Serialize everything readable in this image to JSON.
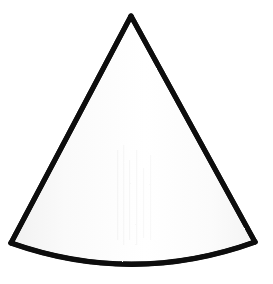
{
  "canvas": {
    "width": 273,
    "height": 284,
    "background_color": "#ffffff",
    "alt_text": "Line drawing of a cone"
  },
  "figure": {
    "name": "cone",
    "shape_type": "cone",
    "stroke_color": "#0d0d0d",
    "stroke_width": 5,
    "fill_color": "#fbfbfb",
    "fill_highlight_color": "#ffffff",
    "fill_shadow_color": "#f1f1f1",
    "geometry": {
      "apex": {
        "x": 131,
        "y": 16
      },
      "base_left_corner": {
        "x": 11,
        "y": 243
      },
      "base_right_corner": {
        "x": 255,
        "y": 242
      },
      "base_arc_bottom_center": {
        "x": 133,
        "y": 263
      },
      "base_ellipse_center": {
        "x": 133,
        "y": 242
      },
      "base_ellipse_radius_x": 122,
      "base_ellipse_radius_y": 21,
      "height_px": 227,
      "base_width_px": 244
    },
    "outline_path": "M 131 16 L 11 243 Q 133 286 255 242 Z",
    "base_arc_path": "M 11 243 Q 133 286 255 242",
    "left_edge_path": "M 131 16 L 11 243",
    "right_edge_path": "M 131 16 L 255 242"
  },
  "texture": {
    "streak_color": "#f2f2f2",
    "streak_opacity": 0.55,
    "streaks_x": [
      118,
      124,
      130,
      136,
      142,
      150
    ]
  }
}
